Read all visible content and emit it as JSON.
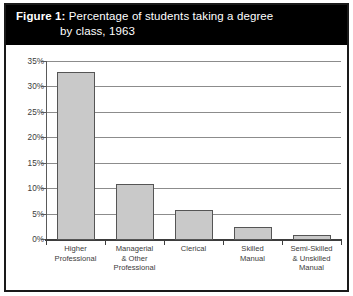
{
  "figure": {
    "title_lead": "Figure 1:",
    "title_rest": " Percentage of students taking a degree",
    "title_line2": "by class, 1963",
    "title_band_color": "#000000",
    "title_text_color": "#ffffff",
    "frame_color": "#1a1a1a",
    "bar_fill_color": "#c9c9c9",
    "bar_border_color": "#555555",
    "gridline_color": "#8c8c8c",
    "axis_color": "#3d3d3d",
    "label_color": "#3b3b3b"
  },
  "chart_data": {
    "type": "bar",
    "title": "Figure 1: Percentage of students taking a degree by class, 1963",
    "xlabel": "",
    "ylabel": "",
    "ylim": [
      0,
      35
    ],
    "ytick_step": 5,
    "grid": true,
    "legend": "none",
    "yticks": [
      "0%",
      "5%",
      "10%",
      "15%",
      "20%",
      "25%",
      "30%",
      "35%"
    ],
    "ytick_values": [
      0,
      5,
      10,
      15,
      20,
      25,
      30,
      35
    ],
    "categories": [
      "Higher Professional",
      "Managerial & Other Professional",
      "Clerical",
      "Skilled Manual",
      "Semi-Skilled & Unskilled Manual"
    ],
    "category_lines": [
      [
        "Higher",
        "Professional"
      ],
      [
        "Managerial",
        "& Other",
        "Professional"
      ],
      [
        "Clerical"
      ],
      [
        "Skilled",
        "Manual"
      ],
      [
        "Semi-Skilled",
        "& Unskilled",
        "Manual"
      ]
    ],
    "values": [
      33,
      11,
      6,
      2.5,
      1
    ]
  }
}
